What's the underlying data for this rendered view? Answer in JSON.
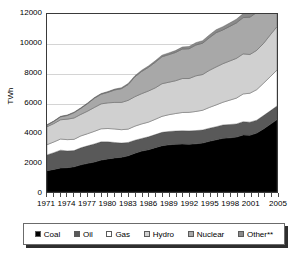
{
  "chart_data": {
    "type": "area",
    "stacked": true,
    "title": "",
    "xlabel": "",
    "ylabel": "TWh",
    "ylim": [
      0,
      12000
    ],
    "yticks": [
      0,
      2000,
      4000,
      6000,
      8000,
      10000,
      12000
    ],
    "ytick_labels": [
      "0",
      "2000",
      "4000",
      "6000",
      "8000",
      "10000",
      "12000"
    ],
    "grid": true,
    "grid_axis": "y",
    "legend_position": "bottom",
    "x": [
      1971,
      1972,
      1973,
      1974,
      1975,
      1976,
      1977,
      1978,
      1979,
      1980,
      1981,
      1982,
      1983,
      1984,
      1985,
      1986,
      1987,
      1988,
      1989,
      1990,
      1991,
      1992,
      1993,
      1994,
      1995,
      1996,
      1997,
      1998,
      1999,
      2000,
      2001,
      2002,
      2003,
      2004,
      2005
    ],
    "xtick_labels": [
      "1971",
      "1974",
      "1977",
      "1980",
      "1983",
      "1986",
      "1989",
      "1992",
      "1995",
      "1998",
      "2001",
      "2005"
    ],
    "xtick_values": [
      1971,
      1974,
      1977,
      1980,
      1983,
      1986,
      1989,
      1992,
      1995,
      1998,
      2001,
      2005
    ],
    "series": [
      {
        "name": "Coal",
        "color": "#000000",
        "values": [
          1440,
          1520,
          1620,
          1640,
          1700,
          1830,
          1930,
          2020,
          2150,
          2230,
          2300,
          2340,
          2440,
          2620,
          2760,
          2850,
          2990,
          3120,
          3180,
          3220,
          3230,
          3220,
          3250,
          3300,
          3420,
          3520,
          3620,
          3650,
          3700,
          3850,
          3830,
          3970,
          4250,
          4560,
          4880
        ]
      },
      {
        "name": "Oil",
        "color": "#595959",
        "values": [
          1060,
          1130,
          1200,
          1130,
          1090,
          1150,
          1180,
          1220,
          1230,
          1150,
          1040,
          960,
          900,
          870,
          850,
          870,
          880,
          900,
          900,
          890,
          900,
          900,
          890,
          880,
          880,
          880,
          900,
          900,
          890,
          890,
          880,
          870,
          900,
          910,
          920
        ]
      },
      {
        "name": "Gas",
        "color": "#ffffff",
        "values": [
          690,
          720,
          750,
          760,
          760,
          800,
          820,
          850,
          880,
          900,
          910,
          900,
          900,
          950,
          980,
          990,
          1030,
          1080,
          1130,
          1180,
          1230,
          1250,
          1290,
          1330,
          1400,
          1470,
          1530,
          1640,
          1740,
          1870,
          1950,
          2060,
          2180,
          2300,
          2420
        ]
      },
      {
        "name": "Hydro",
        "color": "#d0d0d0",
        "values": [
          1210,
          1240,
          1300,
          1380,
          1440,
          1450,
          1520,
          1610,
          1680,
          1730,
          1790,
          1840,
          1940,
          1990,
          2040,
          2100,
          2120,
          2200,
          2190,
          2210,
          2290,
          2280,
          2400,
          2410,
          2500,
          2560,
          2600,
          2640,
          2680,
          2700,
          2610,
          2650,
          2680,
          2820,
          2930
        ]
      },
      {
        "name": "Nuclear",
        "color": "#a8a8a8",
        "values": [
          110,
          150,
          200,
          250,
          360,
          410,
          510,
          620,
          650,
          710,
          840,
          930,
          1070,
          1340,
          1500,
          1600,
          1730,
          1820,
          1860,
          1910,
          1990,
          2010,
          2080,
          2110,
          2200,
          2310,
          2280,
          2330,
          2390,
          2450,
          2520,
          2560,
          2510,
          2620,
          2630
        ]
      },
      {
        "name": "Other**",
        "color": "#8a8a8a",
        "values": [
          25,
          28,
          30,
          32,
          35,
          38,
          42,
          45,
          48,
          52,
          56,
          60,
          66,
          72,
          80,
          88,
          96,
          105,
          115,
          125,
          135,
          145,
          158,
          170,
          185,
          200,
          215,
          232,
          250,
          268,
          285,
          305,
          330,
          355,
          385
        ]
      }
    ]
  },
  "legend": {
    "items": [
      {
        "label": "Coal",
        "color": "#000000"
      },
      {
        "label": "Oil",
        "color": "#595959"
      },
      {
        "label": "Gas",
        "color": "#ffffff"
      },
      {
        "label": "Hydro",
        "color": "#d0d0d0"
      },
      {
        "label": "Nuclear",
        "color": "#a8a8a8"
      },
      {
        "label": "Other**",
        "color": "#8a8a8a"
      }
    ]
  }
}
